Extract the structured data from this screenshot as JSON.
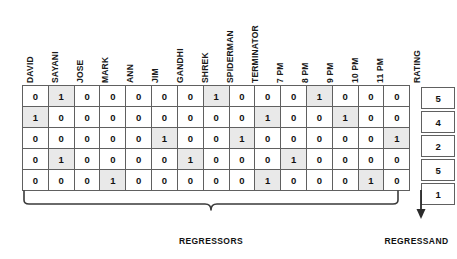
{
  "figure": {
    "type": "table",
    "columns": [
      "DAVID",
      "SAYANI",
      "JOSE",
      "MARK",
      "ANN",
      "JIM",
      "GANDHI",
      "SHREK",
      "SPIDERMAN",
      "TERMINATOR",
      "7 PM",
      "8 PM",
      "9 PM",
      "10 PM",
      "11 PM"
    ],
    "target_column": "RATING",
    "rows": [
      {
        "values": [
          0,
          1,
          0,
          0,
          0,
          0,
          0,
          1,
          0,
          0,
          0,
          1,
          0,
          0,
          0
        ],
        "rating": 5
      },
      {
        "values": [
          1,
          0,
          0,
          0,
          0,
          0,
          0,
          0,
          0,
          1,
          0,
          0,
          1,
          0,
          0
        ],
        "rating": 4
      },
      {
        "values": [
          0,
          0,
          0,
          0,
          0,
          1,
          0,
          0,
          1,
          0,
          0,
          0,
          0,
          0,
          1
        ],
        "rating": 2
      },
      {
        "values": [
          0,
          1,
          0,
          0,
          0,
          0,
          1,
          0,
          0,
          0,
          1,
          0,
          0,
          0,
          0
        ],
        "rating": 5
      },
      {
        "values": [
          0,
          0,
          0,
          1,
          0,
          0,
          0,
          0,
          0,
          1,
          0,
          0,
          0,
          1,
          0
        ],
        "rating": 1
      }
    ],
    "annotations": {
      "regressors_label": "REGRESSORS",
      "regressand_label": "REGRESSAND"
    },
    "colors": {
      "highlight_fill": "#e9e9e9",
      "cell_border": "#606060",
      "text": "#111111",
      "background": "#ffffff"
    }
  },
  "chart_data": {
    "type": "table",
    "title": "",
    "categories": [
      "DAVID",
      "SAYANI",
      "JOSE",
      "MARK",
      "ANN",
      "JIM",
      "GANDHI",
      "SHREK",
      "SPIDERMAN",
      "TERMINATOR",
      "7 PM",
      "8 PM",
      "9 PM",
      "10 PM",
      "11 PM",
      "RATING"
    ],
    "series": [
      {
        "name": "row-1",
        "values": [
          0,
          1,
          0,
          0,
          0,
          0,
          0,
          1,
          0,
          0,
          0,
          1,
          0,
          0,
          0,
          5
        ]
      },
      {
        "name": "row-2",
        "values": [
          1,
          0,
          0,
          0,
          0,
          0,
          0,
          0,
          0,
          1,
          0,
          0,
          1,
          0,
          0,
          4
        ]
      },
      {
        "name": "row-3",
        "values": [
          0,
          0,
          0,
          0,
          0,
          1,
          0,
          0,
          1,
          0,
          0,
          0,
          0,
          0,
          1,
          2
        ]
      },
      {
        "name": "row-4",
        "values": [
          0,
          1,
          0,
          0,
          0,
          0,
          1,
          0,
          0,
          0,
          1,
          0,
          0,
          0,
          0,
          5
        ]
      },
      {
        "name": "row-5",
        "values": [
          0,
          0,
          0,
          1,
          0,
          0,
          0,
          0,
          0,
          1,
          0,
          0,
          0,
          1,
          0,
          1
        ]
      }
    ],
    "xlabel": "REGRESSORS",
    "ylabel": "REGRESSAND",
    "legend": []
  }
}
